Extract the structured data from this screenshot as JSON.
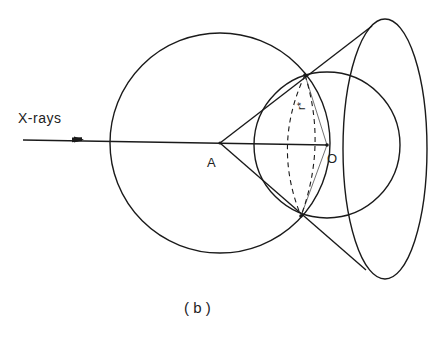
{
  "diagram": {
    "caption": "( b )",
    "labels": {
      "incident_beam": "X-rays",
      "point_a": "A",
      "point_o": "O",
      "radius": "r*"
    },
    "colors": {
      "line": "#1a1a1a",
      "background": "#ffffff"
    },
    "shapes": {
      "sphere_of_reflection": {
        "cx": 220,
        "cy": 143,
        "r": 110
      },
      "limiting_circle": {
        "cx": 327,
        "cy": 145,
        "r": 73
      },
      "cone_apex": {
        "x": 220,
        "y": 143
      },
      "diffraction_ellipse": {
        "cx": 385,
        "cy": 149,
        "rx": 42,
        "ry": 130
      }
    }
  }
}
